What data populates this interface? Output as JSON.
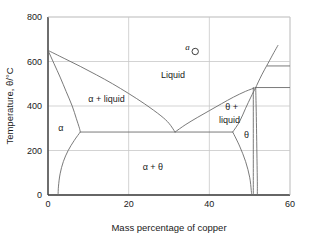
{
  "chart_data": {
    "type": "line",
    "title": "",
    "xlabel": "Mass percentage of copper",
    "ylabel": "Temperature, θ/°C",
    "xlim": [
      0,
      60
    ],
    "ylim": [
      0,
      800
    ],
    "xticks": [
      "0",
      "20",
      "40",
      "60"
    ],
    "xtick_values": [
      0,
      20,
      40,
      60
    ],
    "yticks": [
      "0",
      "200",
      "400",
      "600",
      "800"
    ],
    "ytick_values": [
      0,
      200,
      400,
      600,
      800
    ],
    "grid": true,
    "legend": "none",
    "axis_color": "#3a3a3a",
    "grid_color": "#c8c8c8",
    "curve_color": "#6b6b6b",
    "series": [
      {
        "name": "alpha-liquidus",
        "comment": "Liquidus from pure-A melting point down to eutectic",
        "points": [
          [
            0,
            650
          ],
          [
            4,
            614
          ],
          [
            8,
            578
          ],
          [
            12,
            540
          ],
          [
            16,
            500
          ],
          [
            20,
            456
          ],
          [
            24,
            409
          ],
          [
            28,
            356
          ],
          [
            30,
            322
          ],
          [
            31.5,
            283
          ]
        ]
      },
      {
        "name": "alpha-solidus",
        "comment": "Solidus bounding alpha phase, down to eutectic temperature",
        "points": [
          [
            0,
            650
          ],
          [
            1.5,
            590
          ],
          [
            3,
            530
          ],
          [
            4.5,
            465
          ],
          [
            6,
            400
          ],
          [
            7,
            345
          ],
          [
            7.8,
            300
          ],
          [
            8,
            283
          ]
        ]
      },
      {
        "name": "alpha-solvus",
        "comment": "Solvus: alpha solubility limit falling to low temperature",
        "points": [
          [
            8,
            283
          ],
          [
            6.5,
            245
          ],
          [
            5,
            200
          ],
          [
            3.8,
            150
          ],
          [
            3,
            95
          ],
          [
            2.6,
            40
          ],
          [
            2.5,
            0
          ]
        ]
      },
      {
        "name": "theta-liquidus",
        "comment": "Liquidus rising from eutectic to the right peritectic-like point",
        "points": [
          [
            31.5,
            283
          ],
          [
            34,
            315
          ],
          [
            37,
            348
          ],
          [
            40,
            379
          ],
          [
            43,
            410
          ],
          [
            46,
            440
          ],
          [
            49,
            466
          ],
          [
            51.5,
            483
          ]
        ]
      },
      {
        "name": "theta-solidus",
        "comment": "Solidus boundary of theta+liquid field from eutectic plateau up",
        "points": [
          [
            45.8,
            283
          ],
          [
            47.5,
            330
          ],
          [
            49,
            390
          ],
          [
            50.3,
            440
          ],
          [
            51.5,
            483
          ]
        ]
      },
      {
        "name": "upper-right-liquidus",
        "comment": "Steep liquidus continuing above the 483 C horizontal to the top right",
        "points": [
          [
            51.5,
            483
          ],
          [
            53,
            540
          ],
          [
            54.5,
            590
          ],
          [
            56,
            640
          ],
          [
            57,
            672
          ]
        ]
      },
      {
        "name": "theta-right-solvus",
        "comment": "Right boundary of theta single-phase field descending to the base",
        "points": [
          [
            51.5,
            483
          ],
          [
            51.6,
            400
          ],
          [
            51.7,
            300
          ],
          [
            51.8,
            180
          ],
          [
            51.9,
            60
          ],
          [
            51.9,
            0
          ]
        ]
      },
      {
        "name": "theta-left-solvus",
        "comment": "Left boundary of theta single-phase field descending to the base",
        "points": [
          [
            45.8,
            283
          ],
          [
            47.5,
            220
          ],
          [
            49,
            150
          ],
          [
            50,
            80
          ],
          [
            50.4,
            20
          ],
          [
            50.5,
            0
          ]
        ]
      },
      {
        "name": "theta-inner-boundary",
        "comment": "Narrow inner vertical boundary of the theta field",
        "points": [
          [
            50.9,
            483
          ],
          [
            50.9,
            300
          ],
          [
            50.9,
            120
          ],
          [
            50.9,
            0
          ]
        ]
      }
    ],
    "horizontal_lines": [
      {
        "name": "eutectic-tie-line",
        "comment": "Eutectic horizontal at 283 C spanning alpha solubility limit to theta solidus",
        "y": 283,
        "x_start": 8,
        "x_end": 45.8
      },
      {
        "name": "upper-stub-580",
        "comment": "Short horizontal stub to the right of the steep liquidus",
        "y": 580,
        "x_start": 54.3,
        "x_end": 60
      },
      {
        "name": "upper-stub-483",
        "comment": "Short horizontal stub at the peritectic temperature",
        "y": 483,
        "x_start": 51.5,
        "x_end": 60
      }
    ],
    "point_markers": [
      {
        "name": "point-a",
        "label": "a",
        "x": 36.5,
        "y": 645,
        "marker": "open-circle"
      }
    ],
    "region_labels": [
      {
        "name": "liquid",
        "text": "Liquid",
        "x": 31,
        "y": 540
      },
      {
        "name": "alpha-plus-liquid",
        "text": "α + liquid",
        "x": 14.5,
        "y": 432
      },
      {
        "name": "alpha",
        "text": "α",
        "x": 3.2,
        "y": 300
      },
      {
        "name": "theta-plus-liquid-line1",
        "text": "θ +",
        "x": 45.5,
        "y": 395
      },
      {
        "name": "theta-plus-liquid-line2",
        "text": "liquid",
        "x": 45.0,
        "y": 338
      },
      {
        "name": "theta",
        "text": "θ",
        "x": 49.2,
        "y": 272
      },
      {
        "name": "alpha-plus-theta",
        "text": "α + θ",
        "x": 26,
        "y": 125
      }
    ]
  }
}
